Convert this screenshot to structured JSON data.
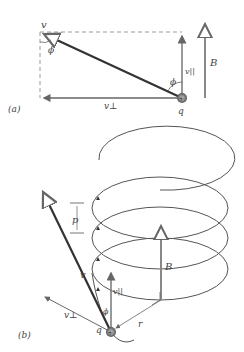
{
  "part_a": {
    "label": "(a)",
    "velocity": "v",
    "v_parallel": "v||",
    "v_perp": "v⊥",
    "angle": "ϕ",
    "charge_label": "q",
    "charge_sign": "+",
    "field": "B"
  },
  "part_b": {
    "label": "(b)",
    "pitch": "p",
    "velocity": "v",
    "v_parallel": "v||",
    "v_perp": "v⊥",
    "angle": "ϕ",
    "radius": "r",
    "charge_label": "q",
    "charge_sign": "+",
    "field": "B"
  },
  "colors": {
    "line": "#555555",
    "dark": "#333333",
    "arrow": "#777777"
  }
}
